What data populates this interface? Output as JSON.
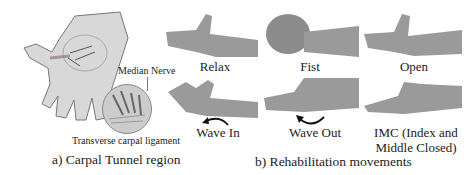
{
  "panel_a": {
    "caption": "a) Carpal Tunnel region",
    "labels": {
      "median_nerve": "Median Nerve",
      "ligament": "Transverse carpal ligament"
    }
  },
  "panel_b": {
    "caption": "b) Rehabilitation movements",
    "gestures": [
      {
        "label": "Relax"
      },
      {
        "label": "Fist"
      },
      {
        "label": "Open"
      },
      {
        "label": "Wave In"
      },
      {
        "label": "Wave Out"
      },
      {
        "label_line1": "IMC (Index and",
        "label_line2": "Middle Closed)"
      }
    ]
  }
}
